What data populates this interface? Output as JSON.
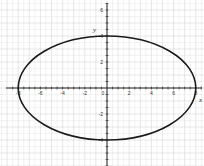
{
  "chart_data": {
    "type": "line",
    "title": "",
    "xlabel": "x",
    "ylabel": "y",
    "xlim": [
      -9,
      9
    ],
    "ylim": [
      -6,
      6.5
    ],
    "grid": true,
    "legend": null,
    "x_ticks": [
      -8,
      -6,
      -4,
      -2,
      0,
      2,
      4,
      6,
      8
    ],
    "x_tick_labels": [
      "-8",
      "-6",
      "-4",
      "-2",
      "0",
      "2",
      "4",
      "6",
      "8"
    ],
    "y_ticks": [
      -4,
      -2,
      2,
      4,
      6
    ],
    "y_tick_labels": [
      "-4",
      "-2",
      "2",
      "4",
      "6"
    ],
    "series": [
      {
        "name": "ellipse",
        "equation": "x^2/64 + y^2/16 = 1",
        "center": [
          0,
          0
        ],
        "semi_axis_x": 8,
        "semi_axis_y": 4,
        "color": "#1a1a1a"
      }
    ]
  },
  "labels": {
    "x_axis": "x",
    "y_axis": "y"
  },
  "colors": {
    "grid_minor": "#e6e6e6",
    "grid_major": "#cccccc",
    "axis": "#222222",
    "curve": "#1a1a1a"
  }
}
